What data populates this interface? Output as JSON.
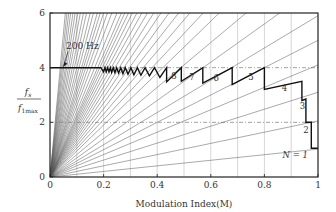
{
  "chart_data": {
    "type": "line",
    "title": "",
    "xlabel": "Modulation Index(M)",
    "ylabel_numerator": "f_s",
    "ylabel_denominator": "f_1max",
    "xlim": [
      0,
      1
    ],
    "ylim": [
      0,
      6
    ],
    "xticks": [
      "0",
      "0.2",
      "0.4",
      "0.6",
      "0.8",
      "1"
    ],
    "xtick_values": [
      0,
      0.2,
      0.4,
      0.6,
      0.8,
      1
    ],
    "yticks": [
      "0",
      "2",
      "4",
      "6"
    ],
    "ytick_values": [
      0,
      2,
      4,
      6
    ],
    "vertical_grid": [
      0.1,
      0.2,
      0.3,
      0.4,
      0.5,
      0.6,
      0.7,
      0.8,
      0.9
    ],
    "dashed_hlines": [
      2,
      4
    ],
    "annotation": {
      "text": "200 Hz",
      "arrow_to": [
        0.05,
        4.0
      ],
      "text_at": [
        0.06,
        4.7
      ]
    },
    "ray_slopes": [
      1.02,
      2.05,
      3.1,
      4.1,
      5.0,
      5.9,
      7.0,
      8.2,
      9.5,
      10.5,
      11.5,
      12.5,
      13.5,
      14.5,
      15.5,
      16.5,
      17.5,
      18.5,
      19.5,
      20.5,
      21.5,
      22.5,
      24,
      26,
      28,
      30,
      32,
      34,
      37,
      40,
      44,
      48,
      53,
      58,
      64,
      70,
      78,
      86,
      95,
      105
    ],
    "bold_curve": {
      "name": "Switching frequency",
      "points": [
        [
          0,
          4.0
        ],
        [
          0.19,
          4.0
        ],
        [
          0.2,
          3.85
        ],
        [
          0.205,
          4.0
        ],
        [
          0.21,
          3.85
        ],
        [
          0.215,
          4.0
        ],
        [
          0.22,
          3.85
        ],
        [
          0.225,
          4.0
        ],
        [
          0.23,
          3.83
        ],
        [
          0.236,
          4.0
        ],
        [
          0.242,
          3.82
        ],
        [
          0.249,
          4.0
        ],
        [
          0.256,
          3.8
        ],
        [
          0.264,
          4.0
        ],
        [
          0.272,
          3.78
        ],
        [
          0.281,
          4.0
        ],
        [
          0.291,
          3.76
        ],
        [
          0.302,
          4.0
        ],
        [
          0.313,
          3.74
        ],
        [
          0.326,
          4.0
        ],
        [
          0.339,
          3.72
        ],
        [
          0.355,
          4.0
        ],
        [
          0.371,
          3.7
        ],
        [
          0.39,
          4.0
        ],
        [
          0.41,
          3.64
        ],
        [
          0.435,
          4.0
        ],
        [
          0.435,
          3.48
        ],
        [
          0.49,
          4.0
        ],
        [
          0.49,
          3.5
        ],
        [
          0.57,
          4.0
        ],
        [
          0.57,
          3.43
        ],
        [
          0.68,
          4.0
        ],
        [
          0.68,
          3.38
        ],
        [
          0.8,
          4.0
        ],
        [
          0.8,
          3.2
        ],
        [
          0.94,
          3.5
        ],
        [
          0.94,
          2.8
        ],
        [
          0.955,
          2.85
        ],
        [
          0.955,
          2.0
        ],
        [
          0.975,
          2.0
        ],
        [
          0.975,
          1.05
        ],
        [
          1.0,
          1.05
        ]
      ]
    },
    "region_labels": [
      {
        "text": "8",
        "x": 0.463,
        "y": 3.58
      },
      {
        "text": "7",
        "x": 0.53,
        "y": 3.55
      },
      {
        "text": "6",
        "x": 0.62,
        "y": 3.52
      },
      {
        "text": "5",
        "x": 0.75,
        "y": 3.55
      },
      {
        "text": "4",
        "x": 0.875,
        "y": 3.15
      },
      {
        "text": "3",
        "x": 0.942,
        "y": 2.5
      },
      {
        "text": "2",
        "x": 0.955,
        "y": 1.6
      },
      {
        "text": "N = 1",
        "x": 0.915,
        "y": 0.7
      }
    ]
  },
  "colors": {
    "axis": "#222222",
    "grid": "#bbbbbb",
    "ray": "#555555",
    "bold": "#111111",
    "text": "#333333"
  }
}
